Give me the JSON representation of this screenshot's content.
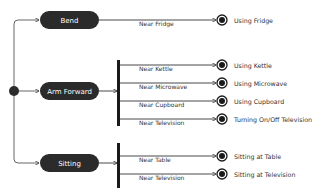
{
  "colors": {
    "node_fill": "#2b2b2b",
    "line": "#333333",
    "state_text": "#ffffff",
    "label_text": "#333333",
    "background": "#ffffff"
  },
  "diagram": {
    "type": "UML activity/state diagram",
    "start_node": {
      "icon": "initial-node-icon"
    },
    "states": [
      {
        "id": "bend",
        "label": "Bend"
      },
      {
        "id": "arm_forward",
        "label": "Arm Forward"
      },
      {
        "id": "sitting",
        "label": "Sitting"
      }
    ],
    "transitions": {
      "bend": [
        {
          "guard": "Near Fridge",
          "target": "Using Fridge"
        }
      ],
      "arm_forward": [
        {
          "guard": "Near Kettle",
          "target": "Using Kettle"
        },
        {
          "guard": "Near Microwave",
          "target": "Using Microwave"
        },
        {
          "guard": "Near Cupboard",
          "target": "Using Cupboard"
        },
        {
          "guard": "Near Television",
          "target": "Turning On/Off Television"
        }
      ],
      "sitting": [
        {
          "guard": "Near Table",
          "target": "Sitting at Table"
        },
        {
          "guard": "Near Television",
          "target": "Sitting at Television"
        }
      ]
    },
    "end_node_icon": "final-node-icon",
    "fork_bar_icon": "fork-bar-icon"
  }
}
